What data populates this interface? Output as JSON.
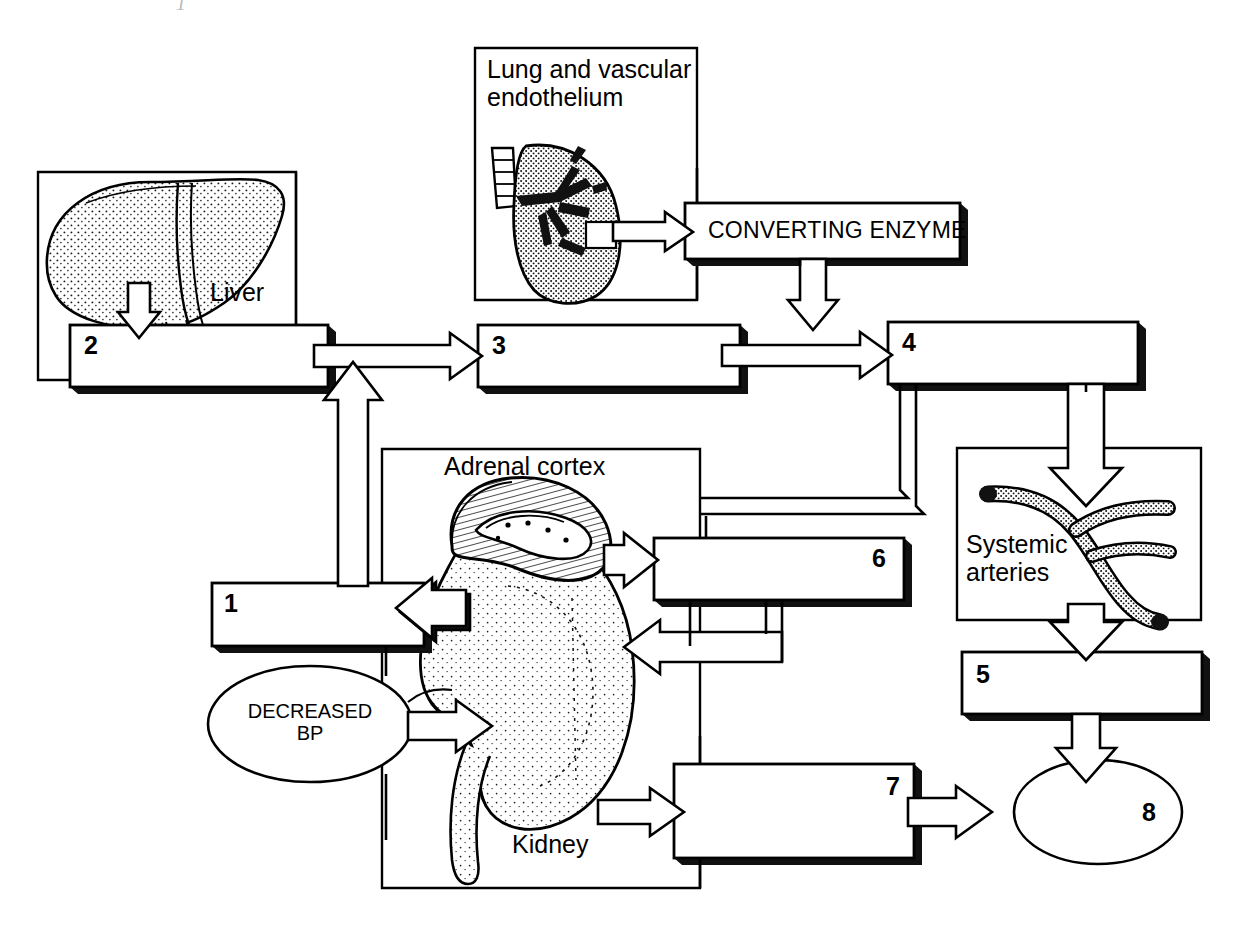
{
  "diagram": {
    "background_color": "#ffffff",
    "line_color": "#000000",
    "frames": [
      {
        "id": "liver-frame",
        "label": "Liver",
        "label_x": 210,
        "label_y": 278,
        "x": 38,
        "y": 172,
        "w": 258,
        "h": 208
      },
      {
        "id": "lung-frame",
        "label": "Lung and vascular\nendothelium",
        "label_x": 487,
        "label_y": 55,
        "x": 475,
        "y": 48,
        "w": 222,
        "h": 252
      },
      {
        "id": "kidney-frame",
        "label": "Kidney",
        "label_x": 512,
        "label_y": 830,
        "x": 382,
        "y": 449,
        "w": 318,
        "h": 439
      },
      {
        "id": "adrenal-label",
        "label": "Adrenal cortex",
        "label_x": 444,
        "label_y": 452,
        "x": 0,
        "y": 0,
        "w": 0,
        "h": 0
      },
      {
        "id": "arteries-frame",
        "label": "Systemic\narteries",
        "label_x": 966,
        "label_y": 530,
        "x": 957,
        "y": 448,
        "w": 244,
        "h": 172
      }
    ],
    "boxes": [
      {
        "id": "box-1",
        "number": "1",
        "x": 212,
        "y": 583,
        "w": 212,
        "h": 63,
        "num_pos": "left"
      },
      {
        "id": "box-2",
        "number": "2",
        "x": 70,
        "y": 325,
        "w": 258,
        "h": 62,
        "num_pos": "left"
      },
      {
        "id": "box-3",
        "number": "3",
        "x": 478,
        "y": 325,
        "w": 262,
        "h": 62,
        "num_pos": "left"
      },
      {
        "id": "box-4",
        "number": "4",
        "x": 888,
        "y": 322,
        "w": 250,
        "h": 62,
        "num_pos": "left"
      },
      {
        "id": "box-5",
        "number": "5",
        "x": 962,
        "y": 652,
        "w": 240,
        "h": 62,
        "num_pos": "left"
      },
      {
        "id": "box-6",
        "number": "6",
        "x": 654,
        "y": 538,
        "w": 250,
        "h": 62,
        "num_pos": "right"
      },
      {
        "id": "box-7",
        "number": "7",
        "x": 674,
        "y": 764,
        "w": 240,
        "h": 94,
        "num_pos": "right"
      }
    ],
    "ellipses": [
      {
        "id": "ellipse-decreased-bp",
        "text": "DECREASED\nBP",
        "cx": 310,
        "cy": 724,
        "rx": 102,
        "ry": 58,
        "text_x": 255,
        "text_y": 700
      },
      {
        "id": "ellipse-8",
        "text": "8",
        "cx": 1098,
        "cy": 812,
        "rx": 84,
        "ry": 52,
        "text_x": 1148,
        "text_y": 800
      }
    ],
    "enzyme_box": {
      "id": "converting-enzyme-box",
      "label": "CONVERTING ENZYME",
      "x": 685,
      "y": 203,
      "w": 275,
      "h": 56,
      "label_x": 708,
      "label_y": 218
    },
    "organ_illustrations": [
      {
        "id": "liver-illustration",
        "name": "liver-drawing"
      },
      {
        "id": "lung-illustration",
        "name": "lung-drawing"
      },
      {
        "id": "kidney-illustration",
        "name": "kidney-and-adrenal-drawing"
      },
      {
        "id": "artery-illustration",
        "name": "branching-artery-drawing"
      }
    ],
    "scan_artifact": "1"
  }
}
